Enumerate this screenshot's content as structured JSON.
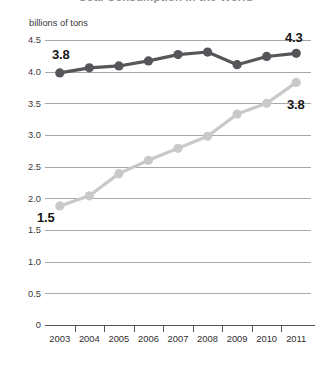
{
  "chart": {
    "title": "Coal Consumption in the World",
    "y_axis_unit_label": "billions of tons",
    "y_ticks": [
      "4.5",
      "4.0",
      "3.5",
      "3.0",
      "2.5",
      "2.0",
      "1.5",
      "1.0",
      "0.5",
      "0"
    ],
    "x_ticks": [
      "2003",
      "2004",
      "2005",
      "2006",
      "2007",
      "2008",
      "2009",
      "2010",
      "2011"
    ],
    "annotations": {
      "dark_start": "3.8",
      "dark_end": "4.3",
      "light_start": "1.5",
      "light_end": "3.8"
    },
    "colors": {
      "dark_series": "#57555a",
      "light_series": "#c9c9c9",
      "gridline": "#a8a8a8",
      "axis": "#55535a",
      "text": "#231f20"
    }
  },
  "chart_data": {
    "type": "line",
    "title": "Coal Consumption in the World",
    "xlabel": "",
    "ylabel": "billions of tons",
    "x": [
      "2003",
      "2004",
      "2005",
      "2006",
      "2007",
      "2008",
      "2009",
      "2010",
      "2011"
    ],
    "ylim": [
      0,
      4.5
    ],
    "yticks": [
      0,
      0.5,
      1.0,
      1.5,
      2.0,
      2.5,
      3.0,
      3.5,
      4.0,
      4.5
    ],
    "grid": true,
    "legend": "none",
    "series": [
      {
        "name": "dark-series",
        "color": "#57555a",
        "values": [
          3.98,
          4.06,
          4.09,
          4.17,
          4.27,
          4.31,
          4.11,
          4.24,
          4.29
        ],
        "start_label": "3.8",
        "end_label": "4.3"
      },
      {
        "name": "light-series",
        "color": "#c9c9c9",
        "values": [
          1.88,
          2.04,
          2.39,
          2.6,
          2.79,
          2.98,
          3.33,
          3.5,
          3.83
        ],
        "start_label": "1.5",
        "end_label": "3.8"
      }
    ]
  }
}
